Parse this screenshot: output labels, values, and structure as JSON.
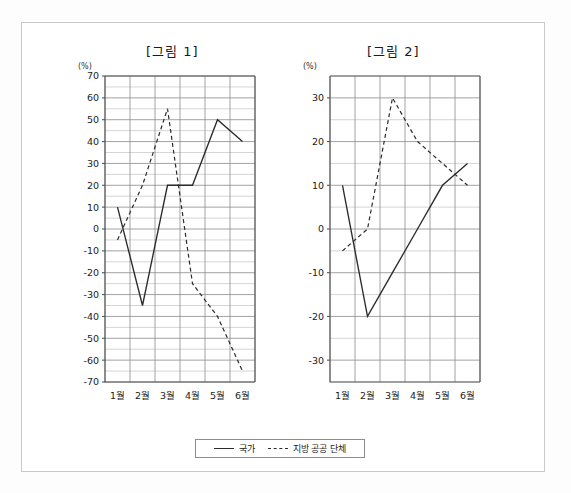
{
  "figure": {
    "unit_label": "(%)",
    "legend": {
      "items": [
        {
          "label": "국가",
          "style": "solid"
        },
        {
          "label": "지방 공공 단체",
          "style": "dashed"
        }
      ]
    }
  },
  "chart_data": [
    {
      "type": "line",
      "title": "[그림 1]",
      "xlabel": "",
      "ylabel": "(%)",
      "categories": [
        "1월",
        "2월",
        "3월",
        "4월",
        "5월",
        "6월"
      ],
      "ylim": [
        -70,
        70
      ],
      "ytick_labels": [
        "70",
        "60",
        "50",
        "40",
        "30",
        "20",
        "10",
        "0",
        "-10",
        "-20",
        "-30",
        "-40",
        "-50",
        "-60",
        "-70"
      ],
      "ytick_values": [
        70,
        60,
        50,
        40,
        30,
        20,
        10,
        0,
        -10,
        -20,
        -30,
        -40,
        -50,
        -60,
        -70
      ],
      "minor_tick_step": 5,
      "grid": true,
      "legend_position": "bottom",
      "series": [
        {
          "name": "국가",
          "style": "solid",
          "values": [
            10,
            -35,
            20,
            20,
            50,
            40
          ]
        },
        {
          "name": "지방 공공 단체",
          "style": "dashed",
          "values": [
            -5,
            20,
            55,
            -25,
            -40,
            -65
          ]
        }
      ]
    },
    {
      "type": "line",
      "title": "[그림 2]",
      "xlabel": "",
      "ylabel": "(%)",
      "categories": [
        "1월",
        "2월",
        "3월",
        "4월",
        "5월",
        "6월"
      ],
      "ylim": [
        -35,
        35
      ],
      "ytick_labels": [
        "30",
        "20",
        "10",
        "0",
        "-10",
        "-20",
        "-30"
      ],
      "ytick_values": [
        30,
        20,
        10,
        0,
        -10,
        -20,
        -30
      ],
      "minor_tick_step": 5,
      "grid": true,
      "legend_position": "bottom",
      "series": [
        {
          "name": "국가",
          "style": "solid",
          "values": [
            10,
            -20,
            -10,
            0,
            10,
            15
          ]
        },
        {
          "name": "지방 공공 단체",
          "style": "dashed",
          "values": [
            -5,
            0,
            30,
            20,
            15,
            10
          ]
        }
      ]
    }
  ]
}
